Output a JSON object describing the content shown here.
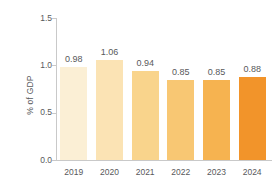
{
  "chart_data": {
    "type": "bar",
    "title": "",
    "subtitle": "",
    "xlabel": "",
    "ylabel": "% of GDP",
    "categories": [
      "2019",
      "2020",
      "2021",
      "2022",
      "2023",
      "2024"
    ],
    "values": [
      0.98,
      1.06,
      0.94,
      0.85,
      0.85,
      0.88
    ],
    "data_labels": [
      "0.98",
      "1.06",
      "0.94",
      "0.85",
      "0.85",
      "0.88"
    ],
    "ylim": [
      0.0,
      1.5
    ],
    "ytick_labels": [
      "0.0",
      "0.5",
      "1.0",
      "1.5"
    ],
    "ytick_values": [
      0.0,
      0.5,
      1.0,
      1.5
    ],
    "grid": false,
    "legend": null,
    "bar_colors": [
      "#fbefd5",
      "#fbe3b4",
      "#f9d48c",
      "#f8c773",
      "#f6b350",
      "#f2942a"
    ],
    "axis_color": "#c9c9c9",
    "text_color": "#58595b"
  }
}
